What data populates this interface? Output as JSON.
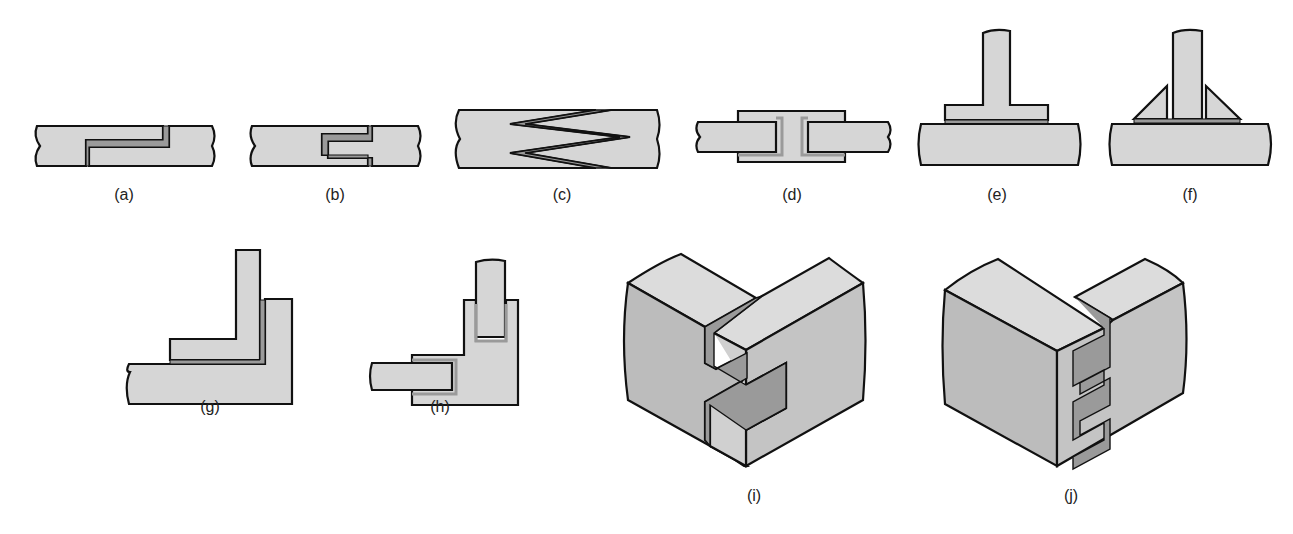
{
  "figure": {
    "colors": {
      "fill": "#d6d6d6",
      "face_dark": "#bcbcbc",
      "face_top": "#dcdcdc",
      "adhesive": "#9a9a9a",
      "stroke": "#111111",
      "background": "#ffffff"
    },
    "panels": [
      {
        "id": "a",
        "label": "(a)",
        "description": "lap-step butt joint",
        "label_x": 124,
        "label_y": 196
      },
      {
        "id": "b",
        "label": "(b)",
        "description": "tongue and groove joint",
        "label_x": 335,
        "label_y": 196
      },
      {
        "id": "c",
        "label": "(c)",
        "description": "double scarf zigzag joint",
        "label_x": 562,
        "label_y": 196
      },
      {
        "id": "d",
        "label": "(d)",
        "description": "double strap channel joint",
        "label_x": 792,
        "label_y": 196
      },
      {
        "id": "e",
        "label": "(e)",
        "description": "T-flange joint",
        "label_x": 997,
        "label_y": 196
      },
      {
        "id": "f",
        "label": "(f)",
        "description": "gusseted T joint",
        "label_x": 1190,
        "label_y": 196
      },
      {
        "id": "g",
        "label": "(g)",
        "description": "L corner lap joint",
        "label_x": 210,
        "label_y": 408
      },
      {
        "id": "h",
        "label": "(h)",
        "description": "corner socket joint",
        "label_x": 440,
        "label_y": 408
      },
      {
        "id": "i",
        "label": "(i)",
        "description": "isometric corner tenon joint",
        "label_x": 754,
        "label_y": 497
      },
      {
        "id": "j",
        "label": "(j)",
        "description": "isometric corner dovetail-like joint",
        "label_x": 1071,
        "label_y": 497
      }
    ]
  }
}
